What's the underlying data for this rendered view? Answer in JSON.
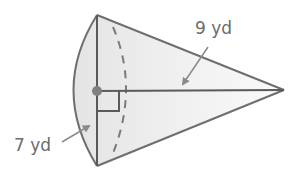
{
  "diagram": {
    "shape": "cone",
    "orientation": "apex-right",
    "labels": {
      "slant_height": "9 yd",
      "radius": "7 yd"
    },
    "markers": {
      "center_point": "center-dot",
      "right_angle": "right-angle-marker"
    },
    "colors": {
      "outline": "#6e6e6e",
      "fill": "#ececec",
      "label": "#6b6b6b",
      "arrow": "#8a8a8a",
      "dot": "#808080"
    }
  }
}
